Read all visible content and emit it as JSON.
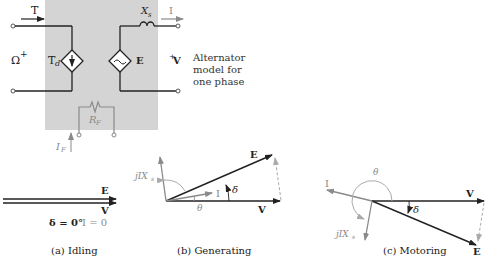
{
  "circuit": {
    "torque_label": "T",
    "speed_label": "Ω",
    "speed_sign": "+",
    "damping_label": "T",
    "damping_sub": "d",
    "emf_label": "E",
    "reactance_label": "X",
    "reactance_sub": "s",
    "current_label": "I",
    "voltage_label": "V",
    "voltage_sign": "+",
    "field_resistor_label": "R",
    "field_resistor_sub": "F",
    "field_current_label": "I",
    "field_current_sub": "F",
    "side_note": [
      "Alternator",
      "model for",
      "one phase"
    ],
    "colors": {
      "box_fill": "#d4d4d4",
      "wire": "#222222",
      "field": "#8a8a8a"
    }
  },
  "phasors": {
    "idling": {
      "E": "E",
      "V": "V",
      "delta_text": "δ = 0°",
      "current_text": "I = 0",
      "caption": "(a) Idling"
    },
    "generating": {
      "E": "E",
      "V": "V",
      "I": "I",
      "jIX": "jIX",
      "jIX_sub": "s",
      "delta": "δ",
      "theta": "θ",
      "caption": "(b) Generating"
    },
    "motoring": {
      "E": "E",
      "V": "V",
      "I": "I",
      "jIX": "jIX",
      "jIX_sub": "s",
      "delta": "δ",
      "theta": "θ",
      "caption": "(c) Motoring"
    }
  }
}
